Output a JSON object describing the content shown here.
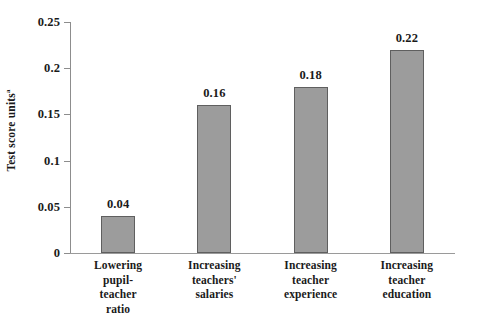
{
  "chart_data": {
    "type": "bar",
    "title": "",
    "xlabel": "",
    "ylabel": "Test score units",
    "ylabel_footnote": "a",
    "categories": [
      "Lowering pupil-teacher ratio",
      "Increasing teachers' salaries",
      "Increasing teacher experience",
      "Increasing teacher education"
    ],
    "category_lines": [
      [
        "Lowering",
        "pupil-",
        "teacher",
        "ratio"
      ],
      [
        "Increasing",
        "teachers'",
        "salaries"
      ],
      [
        "Increasing",
        "teacher",
        "experience"
      ],
      [
        "Increasing",
        "teacher",
        "education"
      ]
    ],
    "values": [
      0.04,
      0.16,
      0.18,
      0.22
    ],
    "value_labels": [
      "0.04",
      "0.16",
      "0.18",
      "0.22"
    ],
    "ylim": [
      0,
      0.25
    ],
    "yticks": [
      0,
      0.05,
      0.1,
      0.15,
      0.2,
      0.25
    ],
    "ytick_labels": [
      "0",
      "0.05",
      "0.1",
      "0.15",
      "0.2",
      "0.25"
    ],
    "grid": false,
    "legend": null,
    "bar_color": "#9c9c9c",
    "bar_edge_color": "#5f5f5f",
    "axis_color": "#8d8d8d",
    "text_color": "#1a1a1a",
    "background": "#ffffff"
  }
}
